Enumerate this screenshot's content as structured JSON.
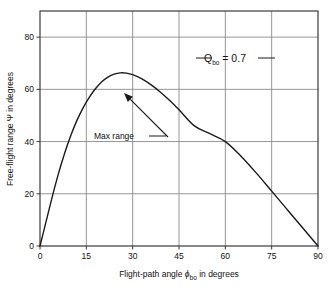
{
  "chart_data": {
    "type": "line",
    "title": "",
    "xlabel": "Flight-path angle φbo in degrees",
    "xlabel_main": "Flight-path angle ",
    "xlabel_sym": "ϕ",
    "xlabel_sub": "bo",
    "xlabel_tail": " in degrees",
    "ylabel": "Free-flight range Ψ in degrees",
    "ylabel_main": "Free-flight range ",
    "ylabel_sym": "Ψ",
    "ylabel_tail": " in degrees",
    "xlim": [
      0,
      90
    ],
    "ylim": [
      0,
      90
    ],
    "xticks": [
      "0",
      "15",
      "30",
      "45",
      "60",
      "75",
      "90"
    ],
    "xtick_values": [
      0,
      15,
      30,
      45,
      60,
      75,
      90
    ],
    "yticks": [
      "0",
      "20",
      "40",
      "60",
      "80"
    ],
    "ytick_values": [
      0,
      20,
      40,
      60,
      80
    ],
    "grid": true,
    "legend": "none",
    "series": [
      {
        "name": "Free-flight range vs flight-path angle",
        "x": [
          0,
          2,
          4,
          6,
          8,
          10,
          12,
          14,
          16,
          18,
          20,
          22,
          24,
          26,
          28,
          30,
          33,
          36,
          39,
          42,
          45,
          50,
          55,
          60,
          65,
          70,
          75,
          80,
          85,
          90
        ],
        "y": [
          0,
          9.5,
          19.0,
          27.8,
          35.6,
          42.4,
          48.2,
          53.0,
          57.0,
          60.3,
          62.9,
          64.7,
          65.8,
          66.3,
          66.2,
          65.6,
          64.0,
          61.7,
          58.9,
          55.7,
          52.2,
          46.0,
          43.0,
          40.0,
          34.5,
          28.0,
          21.0,
          14.0,
          7.0,
          0
        ]
      }
    ],
    "annotations": [
      {
        "name": "max-range",
        "text": "Max  range",
        "label_x": 114,
        "label_y": 139,
        "arrow_from_x": 168,
        "arrow_from_y": 137,
        "arrow_to_x": 124,
        "arrow_to_y": 93,
        "dash_x1": 149,
        "dash_x2": 166,
        "dash_y": 136
      }
    ],
    "parameter_label": {
      "name": "Q-bo-parameter",
      "symbol": "Q",
      "subscript": "bo",
      "equals": " = ",
      "value": "0.7",
      "full_text": "Qbo = 0.7",
      "x": 225,
      "y": 62,
      "dash_left_x1": 196,
      "dash_left_x2": 212,
      "dash_right_x1": 258,
      "dash_right_x2": 275,
      "dash_y": 58
    },
    "colors": {
      "curve": "#1a1a1a",
      "grid": "#8a8a8a",
      "frame": "#3a3a3a",
      "text": "#1a1a1a",
      "background": "#ffffff"
    }
  }
}
